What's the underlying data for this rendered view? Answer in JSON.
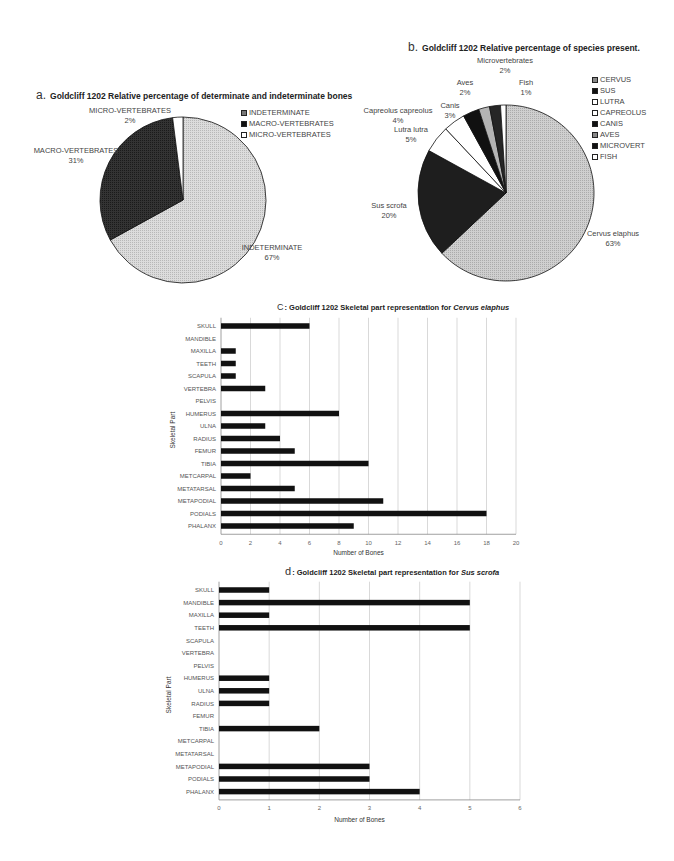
{
  "chart_data": [
    {
      "id": "a",
      "type": "pie",
      "letter": "a.",
      "title": "Goldcliff 1202 Relative percentage of determinate and indeterminate bones",
      "categories": [
        "INDETERMINATE",
        "MACRO-VERTEBRATES",
        "MICRO-VERTEBRATES"
      ],
      "values": [
        67,
        31,
        2
      ],
      "labels": [
        "INDETERMINATE\n67%",
        "MACRO-VERTEBRATES\n31%",
        "MICRO-VERTEBRATES\n2%"
      ],
      "colors": [
        "#d4d4d4",
        "#2a2a2a",
        "#ffffff"
      ],
      "legend": [
        "INDETERMINATE",
        "MACRO-VERTEBRATES",
        "MICRO-VERTEBRATES"
      ],
      "legend_position": "top-right"
    },
    {
      "id": "b",
      "type": "pie",
      "letter": "b.",
      "title": "Goldcliff 1202 Relative percentage of species present.",
      "categories": [
        "Cervus elaphus",
        "Sus scrofa",
        "Lutra lutra",
        "Capreolus capreolus",
        "Canis",
        "Aves",
        "Microvertebrates",
        "Fish"
      ],
      "values": [
        63,
        20,
        5,
        4,
        3,
        2,
        2,
        1
      ],
      "colors": [
        "#c8c8c8",
        "#1e1e1e",
        "#ffffff",
        "#ffffff",
        "#111111",
        "#b0b0b0",
        "#222222",
        "#ffffff"
      ],
      "legend": [
        "CERVUS",
        "SUS",
        "LUTRA",
        "CAPREOLUS",
        "CANIS",
        "AVES",
        "MICROVERT",
        "FISH"
      ],
      "legend_position": "right"
    },
    {
      "id": "c",
      "type": "bar",
      "orientation": "horizontal",
      "letter": "C",
      "title": ": Goldcliff 1202 Skeletal part representation for ",
      "title_italic": "Cervus elaphus",
      "categories": [
        "SKULL",
        "MANDIBLE",
        "MAXILLA",
        "TEETH",
        "SCAPULA",
        "VERTEBRA",
        "PELVIS",
        "HUMERUS",
        "ULNA",
        "RADIUS",
        "FEMUR",
        "TIBIA",
        "METCARPAL",
        "METATARSAL",
        "METAPODIAL",
        "PODIALS",
        "PHALANX"
      ],
      "values": [
        6,
        0,
        1,
        1,
        1,
        3,
        0,
        8,
        3,
        4,
        5,
        10,
        2,
        5,
        11,
        18,
        9
      ],
      "xlabel": "Number of Bones",
      "ylabel": "Skeletal Part",
      "xlim": [
        0,
        20
      ],
      "xticks": [
        0,
        2,
        4,
        6,
        8,
        10,
        12,
        14,
        16,
        18,
        20
      ],
      "grid": true
    },
    {
      "id": "d",
      "type": "bar",
      "orientation": "horizontal",
      "letter": "d",
      "title": ": Goldcliff 1202 Skeletal part representation for ",
      "title_italic": "Sus scrofa",
      "categories": [
        "SKULL",
        "MANDIBLE",
        "MAXILLA",
        "TEETH",
        "SCAPULA",
        "VERTEBRA",
        "PELVIS",
        "HUMERUS",
        "ULNA",
        "RADIUS",
        "FEMUR",
        "TIBIA",
        "METCARPAL",
        "METATARSAL",
        "METAPODIAL",
        "PODIALS",
        "PHALANX"
      ],
      "values": [
        1,
        5,
        1,
        5,
        0,
        0,
        0,
        1,
        1,
        1,
        0,
        2,
        0,
        0,
        3,
        3,
        4
      ],
      "xlabel": "Number of Bones",
      "ylabel": "Skeletal Part",
      "xlim": [
        0,
        6
      ],
      "xticks": [
        0,
        1,
        2,
        3,
        4,
        5,
        6
      ],
      "grid": true
    }
  ],
  "pie_a": {
    "letter": "a.",
    "title": "Goldcliff 1202 Relative percentage of determinate and indeterminate bones",
    "labels": {
      "micro_name": "MICRO-VERTEBRATES",
      "micro_pct": "2%",
      "macro_name": "MACRO-VERTEBRATES",
      "macro_pct": "31%",
      "indet_name": "INDETERMINATE",
      "indet_pct": "67%"
    },
    "legend": [
      "INDETERMINATE",
      "MACRO-VERTEBRATES",
      "MICRO-VERTEBRATES"
    ]
  },
  "pie_b": {
    "letter": "b.",
    "title": "Goldcliff 1202 Relative percentage of species present.",
    "labels": {
      "micro_name": "Microvertebrates",
      "micro_pct": "2%",
      "fish_name": "Fish",
      "fish_pct": "1%",
      "aves_name": "Aves",
      "aves_pct": "2%",
      "canis_name": "Canis",
      "canis_pct": "3%",
      "capreolus_name": "Capreolus capreolus",
      "capreolus_pct": "4%",
      "lutra_name": "Lutra lutra",
      "lutra_pct": "5%",
      "sus_name": "Sus scrofa",
      "sus_pct": "20%",
      "cervus_name": "Cervus elaphus",
      "cervus_pct": "63%"
    },
    "legend": [
      "CERVUS",
      "SUS",
      "LUTRA",
      "CAPREOLUS",
      "CANIS",
      "AVES",
      "MICROVERT",
      "FISH"
    ]
  },
  "bar_c": {
    "letter": "C",
    "title": ": Goldcliff 1202 Skeletal part representation for ",
    "title_italic": "Cervus elaphus",
    "xlabel": "Number of Bones",
    "ylabel": "Skeletal Part"
  },
  "bar_d": {
    "letter": "d",
    "title": ": Goldcliff 1202 Skeletal part representation for ",
    "title_italic": "Sus scrofa",
    "xlabel": "Number of Bones",
    "ylabel": "Skeletal Part"
  }
}
